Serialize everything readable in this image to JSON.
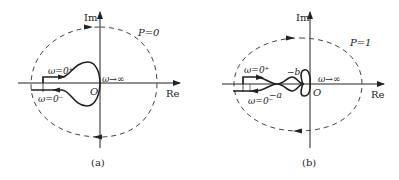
{
  "panels": [
    {
      "id": "a",
      "caption": "(a)",
      "axis_im": "Im",
      "axis_re": "Re",
      "origin": "O",
      "p_label": "P=0",
      "omega_0plus": "ω=0⁺",
      "omega_0minus": "ω=0⁻",
      "omega_inf": "ω→∞"
    },
    {
      "id": "b",
      "caption": "(b)",
      "axis_im": "Im",
      "axis_re": "Re",
      "origin": "O",
      "p_label": "P=1",
      "omega_0plus": "ω=0⁺",
      "omega_0minus": "ω=0⁻",
      "omega_inf": "ω→∞",
      "point_a": "−a",
      "point_b": "−b"
    }
  ],
  "colors": {
    "stroke": "#222222",
    "dash": "#444444"
  }
}
